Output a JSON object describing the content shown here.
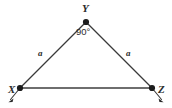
{
  "figure": {
    "type": "geometry-diagram",
    "shape": "isosceles-right-triangle",
    "background_color": "#ffffff",
    "stroke_color": "#3a3a3a",
    "base_stroke_color": "#6e6e6e",
    "vertex_dot_color": "#1c1c1c",
    "text_color": "#2b2b2b"
  },
  "vertices": [
    {
      "name": "Y",
      "label": "Y",
      "x": 86,
      "y": 22
    },
    {
      "name": "X",
      "label": "X",
      "x": 20,
      "y": 88
    },
    {
      "name": "Z",
      "label": "Z",
      "x": 152,
      "y": 88
    }
  ],
  "sides": [
    {
      "name": "XY",
      "label": "a",
      "from": "X",
      "to": "Y"
    },
    {
      "name": "YZ",
      "label": "a",
      "from": "Y",
      "to": "Z"
    },
    {
      "name": "XZ",
      "label": "",
      "from": "X",
      "to": "Z"
    }
  ],
  "angles": [
    {
      "at": "Y",
      "label": "90°"
    }
  ],
  "rays": [
    {
      "name": "ray-from-X",
      "direction": "down-left",
      "from_x": 20,
      "from_y": 88,
      "to_x": 9,
      "to_y": 101
    },
    {
      "name": "ray-from-Z",
      "direction": "down-right",
      "from_x": 152,
      "from_y": 88,
      "to_x": 163,
      "to_y": 101
    }
  ]
}
